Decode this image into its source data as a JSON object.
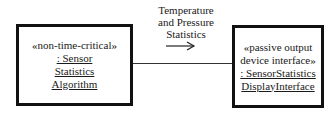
{
  "diagram": {
    "left_object": {
      "stereotype": "«non-time-critical»",
      "name_lines": [
        ": Sensor",
        "Statistics",
        "Algorithm"
      ]
    },
    "right_object": {
      "stereotype_lines": [
        "«passive output",
        "device interface»"
      ],
      "name_lines": [
        ": SensorStatistics",
        "DisplayInterface"
      ]
    },
    "message": {
      "lines": [
        "Temperature",
        "and Pressure",
        "Statistics"
      ],
      "direction": "right-arrow"
    }
  }
}
